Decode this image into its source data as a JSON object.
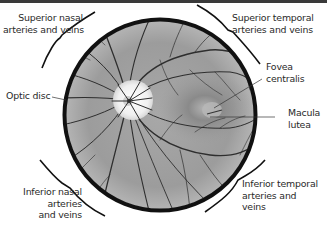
{
  "diagram": {
    "colors": {
      "background": "#ffffff",
      "top_bar": "#3a3a3a",
      "circle_border": "#111111",
      "fundus": "#9a9a9a",
      "vessel": "#2e2e2e",
      "optic_disc": "#f2f2f2",
      "label_text": "#2a2a2a"
    },
    "labels": {
      "superior_nasal": [
        "Superior nasal",
        "arteries and veins"
      ],
      "superior_temporal": [
        "Superior temporal",
        "arteries and veins"
      ],
      "fovea": [
        "Fovea",
        "centralis"
      ],
      "optic_disc": [
        "Optic disc"
      ],
      "macula": [
        "Macula",
        "lutea"
      ],
      "inferior_nasal": [
        "Inferior nasal",
        "arteries",
        "and veins"
      ],
      "inferior_temporal": [
        "Inferior temporal",
        "arteries and",
        "veins"
      ]
    }
  }
}
